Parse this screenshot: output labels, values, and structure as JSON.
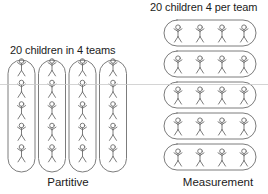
{
  "canvas": {
    "width": 268,
    "height": 194,
    "background": "#ffffff"
  },
  "style": {
    "stroke_color": "#6d6d6d",
    "stroke_width": 0.9,
    "figure_color": "#6d6d6d",
    "text_color": "#1b1b1b",
    "artifact_line_color": "#c9c9c9"
  },
  "panels": {
    "partitive": {
      "title": "20 children in 4 teams",
      "label": "Partitive",
      "group_count": 4,
      "per_group": 5,
      "total_children": 20,
      "orientation": "vertical",
      "groups": [
        {
          "index": 1,
          "children": 5
        },
        {
          "index": 2,
          "children": 5
        },
        {
          "index": 3,
          "children": 5
        },
        {
          "index": 4,
          "children": 5
        }
      ],
      "geometry": {
        "capsule_width": 27,
        "capsule_height": 112,
        "capsule_top": 60,
        "capsule_gap": 3.5,
        "first_capsule_left": 8,
        "figure_step_y": 21.5,
        "figure_first_y": 70
      }
    },
    "measurement": {
      "title": "20 children 4 per team",
      "label": "Measurement",
      "group_count": 5,
      "per_group": 4,
      "total_children": 20,
      "orientation": "horizontal",
      "groups": [
        {
          "index": 1,
          "children": 4
        },
        {
          "index": 2,
          "children": 4
        },
        {
          "index": 3,
          "children": 4
        },
        {
          "index": 4,
          "children": 4
        },
        {
          "index": 5,
          "children": 4
        }
      ],
      "geometry": {
        "capsule_width": 92,
        "capsule_height": 26,
        "capsule_left": 164,
        "capsule_gap": 5,
        "first_capsule_top": 20,
        "figure_step_x": 22,
        "figure_first_x": 178
      }
    }
  },
  "figure_icon": {
    "name": "stick-figure-icon",
    "head_radius": 2.3,
    "body_height": 6.5,
    "arm_span": 8,
    "leg_span": 7
  },
  "artifact": {
    "name": "scan-line",
    "y": 84.5,
    "x_start": 0,
    "x_end": 268
  }
}
